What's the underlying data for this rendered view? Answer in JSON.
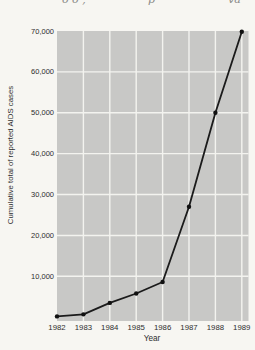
{
  "page": {
    "background_color": "#f7f6f2",
    "top_fragment": {
      "left": "o o ,",
      "mid": "p",
      "right": "va"
    }
  },
  "chart_data": {
    "type": "line",
    "title": "",
    "xlabel": "Year",
    "ylabel": "Cumulative total of reported AIDS cases",
    "x": [
      1982,
      1983,
      1984,
      1985,
      1986,
      1987,
      1988,
      1989
    ],
    "values": [
      200,
      700,
      3500,
      5800,
      8600,
      27000,
      50000,
      69800
    ],
    "ylim": [
      0,
      70000
    ],
    "yticks": [
      10000,
      20000,
      30000,
      40000,
      50000,
      60000,
      70000
    ],
    "ytick_labels": [
      "10,000",
      "20,000",
      "30,000",
      "40,000",
      "50,000",
      "60,000",
      "70,000"
    ],
    "grid": true,
    "legend": "none",
    "plot_bg_color": "#c8c8c6",
    "grid_color": "#f3f3ef",
    "line_color": "#1b1b1b",
    "marker": "circle",
    "marker_color": "#111111",
    "text_color": "#2e2e2e"
  }
}
